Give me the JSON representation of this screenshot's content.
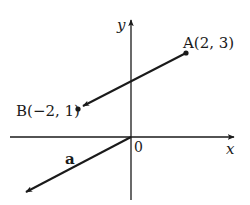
{
  "diagram": {
    "type": "vector-coordinate-plane",
    "colors": {
      "ink": "#1a1a1a",
      "background": "#ffffff"
    },
    "axes": {
      "x_label": "x",
      "y_label": "y",
      "origin_label": "0"
    },
    "points": [
      {
        "id": "A",
        "label": "A(2, 3)",
        "x": 2,
        "y": 3
      },
      {
        "id": "B",
        "label": "B(−2, 1)",
        "x": -2,
        "y": 1
      }
    ],
    "vectors": [
      {
        "id": "AB",
        "from": "A",
        "to": "B",
        "label": ""
      },
      {
        "id": "a",
        "from": [
          0,
          0
        ],
        "to": [
          -4,
          -2
        ],
        "label": "a"
      }
    ]
  }
}
